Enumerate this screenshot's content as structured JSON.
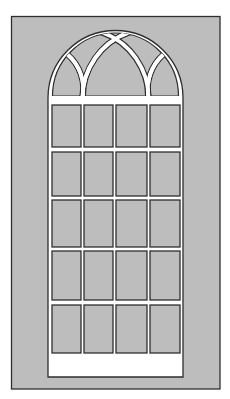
{
  "canvas": {
    "width": 230,
    "height": 399,
    "background": "#ffffff"
  },
  "colors": {
    "panel_fill": "#bdbdbd",
    "outline": "#2e2e2e",
    "frame_white": "#ffffff",
    "pane_fill": "#bdbdbd"
  },
  "outer_panel": {
    "x": 11.5,
    "y": 16.5,
    "width": 208.5,
    "height": 372.5
  },
  "window": {
    "left": 48,
    "right": 183,
    "bottom": 377,
    "arch_center_x": 115.5,
    "arch_center_y": 98,
    "arch_radius": 67.5,
    "grid_columns": 4,
    "grid_rows": 5,
    "pane_cols": [
      [
        52,
        81
      ],
      [
        84,
        113
      ],
      [
        116,
        147
      ],
      [
        150,
        180
      ]
    ],
    "pane_rows": [
      [
        105,
        147
      ],
      [
        152,
        196
      ],
      [
        200,
        247
      ],
      [
        251,
        300
      ],
      [
        305,
        353
      ]
    ]
  },
  "arch_tracery": {
    "spring_line_y": 100,
    "arch_inner_radius": 63,
    "left_lancet": {
      "from": [
        82.5,
        100
      ],
      "to": [
        130,
        32
      ],
      "radius": 70
    },
    "right_lancet": {
      "from": [
        148.5,
        100
      ],
      "to": [
        101,
        32
      ],
      "radius": 70
    },
    "left_side_arc": {
      "from": [
        67,
        54
      ],
      "to": [
        82,
        100
      ],
      "radius": 46
    },
    "right_side_arc": {
      "from": [
        164,
        54
      ],
      "to": [
        149,
        100
      ],
      "radius": 46
    }
  }
}
